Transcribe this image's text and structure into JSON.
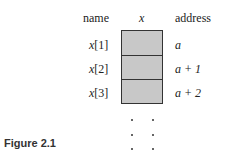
{
  "headers": {
    "name": "name",
    "x": "x",
    "address": "address"
  },
  "rows": [
    {
      "name_var": "x",
      "name_idx": "[1]",
      "address": "a"
    },
    {
      "name_var": "x",
      "name_idx": "[2]",
      "address": "a + 1"
    },
    {
      "name_var": "x",
      "name_idx": "[3]",
      "address": "a + 2"
    }
  ],
  "caption": "Figure 2.1",
  "colors": {
    "cell_fill": "#c8c8c8",
    "cell_border": "#333333"
  }
}
